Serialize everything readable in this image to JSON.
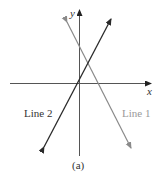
{
  "figure": {
    "caption": "(a)",
    "axes": {
      "x_label": "x",
      "y_label": "y"
    },
    "lines": [
      {
        "name": "Line 1",
        "color": "#8a8a8a",
        "slope": "negative"
      },
      {
        "name": "Line 2",
        "color": "#2a2a2a",
        "slope": "positive"
      }
    ]
  }
}
